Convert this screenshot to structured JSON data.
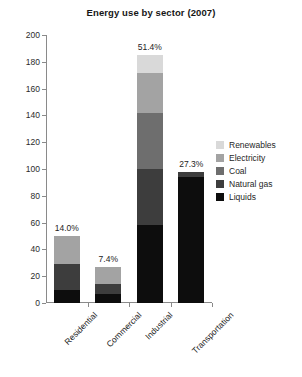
{
  "chart_data": {
    "type": "bar",
    "title": "Energy use by sector (2007)",
    "xlabel": "",
    "ylabel": "",
    "ylim": [
      0,
      200
    ],
    "yticks": [
      0,
      20,
      40,
      60,
      80,
      100,
      120,
      140,
      160,
      180,
      200
    ],
    "grid": false,
    "stacked": true,
    "legend_position": "right",
    "categories": [
      "Residential",
      "Commercial",
      "Industrial",
      "Transportation"
    ],
    "series": [
      {
        "name": "Liquids",
        "color": "#0d0d0d",
        "values": [
          10,
          7,
          58,
          94
        ]
      },
      {
        "name": "Natural gas",
        "color": "#3d3d3d",
        "values": [
          19,
          7,
          42,
          4
        ]
      },
      {
        "name": "Coal",
        "color": "#6e6e6e",
        "values": [
          0,
          0,
          42,
          0
        ]
      },
      {
        "name": "Electricity",
        "color": "#a3a3a3",
        "values": [
          21,
          13,
          30,
          0
        ]
      },
      {
        "name": "Renewables",
        "color": "#d9d9d9",
        "values": [
          0,
          0,
          13,
          0
        ]
      }
    ],
    "totals": [
      50,
      27,
      185,
      98
    ],
    "bar_labels": [
      "14.0%",
      "7.4%",
      "51.4%",
      "27.3%"
    ]
  },
  "legend": {
    "items": [
      {
        "label": "Renewables"
      },
      {
        "label": "Electricity"
      },
      {
        "label": "Coal"
      },
      {
        "label": "Natural gas"
      },
      {
        "label": "Liquids"
      }
    ]
  }
}
